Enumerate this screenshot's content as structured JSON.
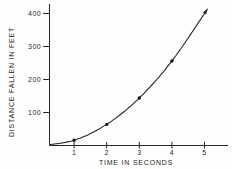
{
  "figure": {
    "background": "#fefefd",
    "ink_color": "#262626"
  },
  "chart_data": {
    "type": "line",
    "title": "",
    "xlabel": "TIME IN SECONDS",
    "ylabel": "DISTANCE FALLEN IN FEET",
    "x_ticks": [
      1,
      2,
      3,
      4,
      5
    ],
    "y_ticks": [
      100,
      200,
      300,
      400
    ],
    "xlim": [
      0,
      5.5
    ],
    "ylim": [
      0,
      440
    ],
    "grid": false,
    "legend": false,
    "series": [
      {
        "name": "distance fallen vs time (free fall)",
        "x": [
          0,
          1,
          2,
          3,
          4,
          5
        ],
        "values": [
          0,
          16,
          64,
          144,
          256,
          400
        ],
        "markers_at": [
          [
            1,
            16
          ],
          [
            2,
            64
          ],
          [
            3,
            144
          ],
          [
            4,
            256
          ]
        ],
        "arrow_at_end": true
      }
    ]
  }
}
